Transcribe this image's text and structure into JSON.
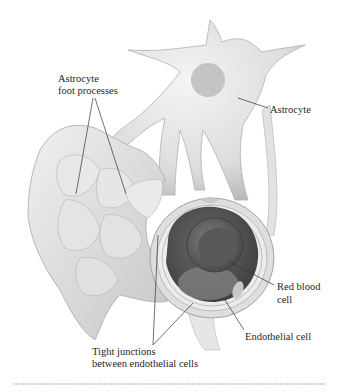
{
  "diagram": {
    "type": "anatomical-illustration",
    "labels": {
      "foot_processes_line1": "Astrocyte",
      "foot_processes_line2": "foot processes",
      "astrocyte": "Astrocyte",
      "rbc_line1": "Red blood",
      "rbc_line2": "cell",
      "endothelial": "Endothelial cell",
      "tight_line1": "Tight junctions",
      "tight_line2": "between endothelial cells"
    },
    "colors": {
      "cell_fill": "#e4e4e4",
      "cell_shadow": "#bdbdbd",
      "nucleus": "#c4c4c4",
      "lumen": "#5a5a5a",
      "rbc": "#6e6e6e",
      "leader_line": "#333333",
      "rule": "#7a7a7a"
    }
  }
}
